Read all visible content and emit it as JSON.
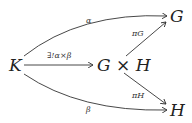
{
  "diagram": {
    "type": "commutative-diagram",
    "nodes": {
      "K": "K",
      "G": "G",
      "GxH": "G × H",
      "H": "H"
    },
    "edges": {
      "alpha": "α",
      "beta": "β",
      "unique": "∃!α×β",
      "piG": "πG",
      "piH": "πH"
    },
    "colors": {
      "stroke": "#333333",
      "text": "#222222"
    }
  }
}
